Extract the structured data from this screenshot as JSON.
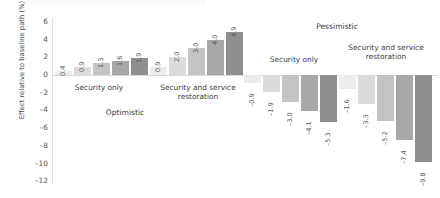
{
  "chart_data": {
    "type": "bar",
    "title": "",
    "xlabel": "",
    "ylabel": "Effect relative to baseline path (%)",
    "ylim": [
      -12,
      6
    ],
    "yticks": [
      6,
      4,
      2,
      0,
      -2,
      -4,
      -6,
      -8,
      -10,
      -12
    ],
    "grid": false,
    "legend": "none",
    "orientation": "vertical",
    "scenarios": [
      {
        "name": "Optimistic",
        "groups": [
          {
            "name": "Security only",
            "values": [
              0.4,
              0.9,
              1.3,
              1.6,
              1.9
            ],
            "labels": [
              "0.4",
              "0.9",
              "1.3",
              "1.6",
              "1.9"
            ]
          },
          {
            "name": "Security and service restoration",
            "values": [
              0.9,
              2.0,
              3.0,
              4.0,
              4.9
            ],
            "labels": [
              "0.9",
              "2.0",
              "3.0",
              "4.0",
              "4.9"
            ]
          }
        ]
      },
      {
        "name": "Pessimistic",
        "groups": [
          {
            "name": "Security only",
            "values": [
              -0.9,
              -1.9,
              -3.0,
              -4.1,
              -5.3
            ],
            "labels": [
              "–0.9",
              "–1.9",
              "–3.0",
              "–4.1",
              "–5.3"
            ]
          },
          {
            "name": "Security and service restoration",
            "values": [
              -1.6,
              -3.3,
              -5.2,
              -7.4,
              -9.8
            ],
            "labels": [
              "–1.6",
              "–3.3",
              "–5.2",
              "–7.4",
              "–9.8"
            ]
          }
        ]
      }
    ],
    "series_shades": [
      "#ececec",
      "#dcdcdc",
      "#c4c4c4",
      "#a8a8a8",
      "#8f8f8f"
    ],
    "tick_labels": [
      "6",
      "4",
      "2",
      "0",
      "–2",
      "–4",
      "–6",
      "–8",
      "–10",
      "–12"
    ]
  },
  "axis": {
    "ylabel": "Effect relative to baseline path (%)"
  },
  "labels": {
    "optimistic": "Optimistic",
    "pessimistic": "Pessimistic",
    "security_only": "Security only",
    "security_and_service_restoration": "Security and service\nrestoration"
  },
  "colors": {
    "shade_1": "#ececec",
    "shade_2": "#dcdcdc",
    "shade_3": "#c4c4c4",
    "shade_4": "#a8a8a8",
    "shade_5": "#8f8f8f",
    "axis": "#e2e2e2",
    "text": "#3b3b3b"
  }
}
